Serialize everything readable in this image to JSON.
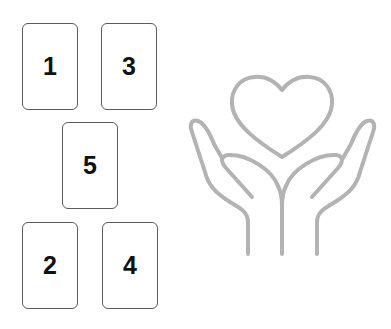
{
  "layout": {
    "name": "five-card-spread",
    "cards": [
      {
        "id": "card-1",
        "label": "1"
      },
      {
        "id": "card-3",
        "label": "3"
      },
      {
        "id": "card-5",
        "label": "5"
      },
      {
        "id": "card-2",
        "label": "2"
      },
      {
        "id": "card-4",
        "label": "4"
      }
    ]
  },
  "illustration": {
    "icon": "hands-holding-heart-icon",
    "stroke_color": "#b3b3b3"
  },
  "colors": {
    "card_border": "#5a5a5a",
    "card_text": "#111111",
    "background": "#ffffff"
  }
}
